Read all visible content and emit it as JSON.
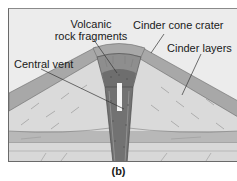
{
  "figure": {
    "caption": "(b)"
  },
  "labels": {
    "volcanic_rock_fragments_line1": "Volcanic",
    "volcanic_rock_fragments_line2": "rock fragments",
    "cinder_cone_crater": "Cinder cone crater",
    "cinder_layers": "Cinder layers",
    "central_vent": "Central vent"
  },
  "colors": {
    "sky": "#ececec",
    "cone_fill": "#d9d9d9",
    "cone_outer_band": "#a9a9a9",
    "vent": "#6f6f6f",
    "vent_core": "#f4f4f4",
    "crater_fill": "#8c8c8c",
    "ground_layer_dark": "#b5b5b5",
    "ground_layer_light": "#d6d6d6",
    "leader_line": "#333333"
  }
}
